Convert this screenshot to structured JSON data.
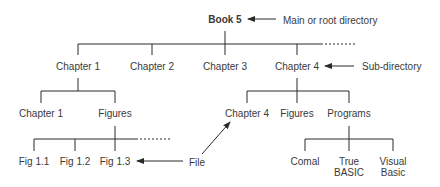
{
  "root": {
    "label": "Book 5",
    "annotation": "Main or root directory"
  },
  "level1": [
    {
      "label": "Chapter 1"
    },
    {
      "label": "Chapter 2"
    },
    {
      "label": "Chapter 3"
    },
    {
      "label": "Chapter 4"
    }
  ],
  "level1_annotation": "Sub-directory",
  "chapter1_children": [
    {
      "label": "Chapter 1"
    },
    {
      "label": "Figures"
    }
  ],
  "figures_children": [
    {
      "label": "Fig 1.1"
    },
    {
      "label": "Fig 1.2"
    },
    {
      "label": "Fig 1.3"
    }
  ],
  "chapter4_children": [
    {
      "label": "Chapter 4"
    },
    {
      "label": "Figures"
    },
    {
      "label": "Programs"
    }
  ],
  "programs_children": [
    {
      "label": "Comal"
    },
    {
      "label": "True",
      "label2": "BASIC"
    },
    {
      "label": "Visual",
      "label2": "Basic"
    }
  ],
  "file_annotation": "File",
  "colors": {
    "line": "#2a2a2a",
    "text": "#3a3a3a",
    "background": "#ffffff"
  }
}
